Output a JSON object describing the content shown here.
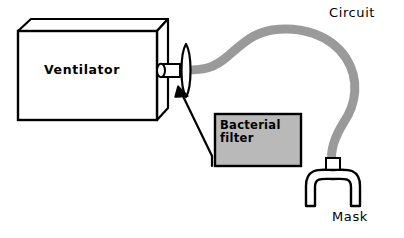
{
  "diagram": {
    "canvas": {
      "width": 404,
      "height": 238,
      "background": "#ffffff"
    },
    "colors": {
      "outline": "#000000",
      "tube_gray": "#9a9a9a",
      "filter_fill": "#b9b9b9",
      "box_face": "#ffffff",
      "box_side": "#ffffff",
      "connector_gray": "#8f8f8f"
    },
    "labels": {
      "ventilator": "Ventilator",
      "circuit": "Circuit",
      "mask": "Mask",
      "filter_line1": "Bacterial",
      "filter_line2": "filter"
    },
    "parts": [
      {
        "name": "ventilator-box",
        "label": "Ventilator"
      },
      {
        "name": "ventilator-port",
        "label": ""
      },
      {
        "name": "breathing-circuit-tube",
        "label": "Circuit"
      },
      {
        "name": "bacterial-filter-box",
        "label": "Bacterial filter"
      },
      {
        "name": "filter-pointer-arrow",
        "label": ""
      },
      {
        "name": "mask",
        "label": "Mask"
      }
    ]
  }
}
